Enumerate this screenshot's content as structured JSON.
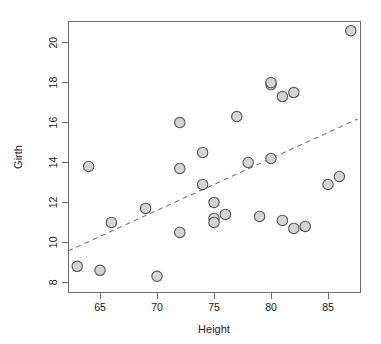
{
  "chart_data": {
    "type": "scatter",
    "title": "",
    "subtitle": "",
    "xlabel": "Height",
    "ylabel": "Girth",
    "xlim": [
      61.6,
      87.9
    ],
    "ylim": [
      7.85,
      20.85
    ],
    "xticks": [
      65,
      70,
      75,
      80,
      85
    ],
    "yticks": [
      8,
      10,
      12,
      14,
      16,
      18,
      20
    ],
    "xtick_labels": [
      "65",
      "70",
      "75",
      "80",
      "85"
    ],
    "ytick_labels": [
      "8",
      "10",
      "12",
      "14",
      "16",
      "18",
      "20"
    ],
    "grid": false,
    "legend": null,
    "legend_position": "none",
    "point_style": {
      "marker": "circle",
      "fill_color": "#d4d4d4",
      "edge_color": "#555555",
      "radius_px": 5.2
    },
    "x": [
      63,
      65,
      70,
      66,
      69,
      72,
      64,
      72,
      74,
      74,
      72,
      75,
      75,
      75,
      76,
      77,
      78,
      79,
      80,
      80,
      80,
      81,
      81,
      82,
      82,
      83,
      85,
      86,
      87
    ],
    "y": [
      8.8,
      8.6,
      8.3,
      11.0,
      11.7,
      13.7,
      13.8,
      16.0,
      14.5,
      12.9,
      10.5,
      12.0,
      11.2,
      11.0,
      11.4,
      16.3,
      14.0,
      11.3,
      14.2,
      17.9,
      18.0,
      11.1,
      17.3,
      17.5,
      10.7,
      10.8,
      12.9,
      13.3,
      20.6
    ],
    "points": [
      {
        "x": 63,
        "y": 8.8
      },
      {
        "x": 65,
        "y": 8.6
      },
      {
        "x": 70,
        "y": 8.3
      },
      {
        "x": 66,
        "y": 11.0
      },
      {
        "x": 69,
        "y": 11.7
      },
      {
        "x": 72,
        "y": 13.7
      },
      {
        "x": 64,
        "y": 13.8
      },
      {
        "x": 72,
        "y": 16.0
      },
      {
        "x": 74,
        "y": 14.5
      },
      {
        "x": 74,
        "y": 12.9
      },
      {
        "x": 72,
        "y": 10.5
      },
      {
        "x": 75,
        "y": 12.0
      },
      {
        "x": 75,
        "y": 11.2
      },
      {
        "x": 75,
        "y": 11.0
      },
      {
        "x": 76,
        "y": 11.4
      },
      {
        "x": 77,
        "y": 16.3
      },
      {
        "x": 78,
        "y": 14.0
      },
      {
        "x": 79,
        "y": 11.3
      },
      {
        "x": 80,
        "y": 14.2
      },
      {
        "x": 80,
        "y": 17.9
      },
      {
        "x": 80,
        "y": 18.0
      },
      {
        "x": 81,
        "y": 11.1
      },
      {
        "x": 81,
        "y": 17.3
      },
      {
        "x": 82,
        "y": 17.5
      },
      {
        "x": 82,
        "y": 10.7
      },
      {
        "x": 83,
        "y": 10.8
      },
      {
        "x": 85,
        "y": 12.9
      },
      {
        "x": 86,
        "y": 13.3
      },
      {
        "x": 87,
        "y": 20.6
      }
    ],
    "series": [
      {
        "name": "trees",
        "type": "scatter",
        "x": [
          63,
          65,
          70,
          66,
          69,
          72,
          64,
          72,
          74,
          74,
          72,
          75,
          75,
          75,
          76,
          77,
          78,
          79,
          80,
          80,
          80,
          81,
          81,
          82,
          82,
          83,
          85,
          86,
          87
        ],
        "values": [
          8.8,
          8.6,
          8.3,
          11.0,
          11.7,
          13.7,
          13.8,
          16.0,
          14.5,
          12.9,
          10.5,
          12.0,
          11.2,
          11.0,
          11.4,
          16.3,
          14.0,
          11.3,
          14.2,
          17.9,
          18.0,
          11.1,
          17.3,
          17.5,
          10.7,
          10.8,
          12.9,
          13.3,
          20.6
        ]
      },
      {
        "name": "trend-line",
        "type": "line",
        "style": "dashed",
        "color": "#777777",
        "x": [
          62.2,
          87.6
        ],
        "values": [
          9.57,
          16.18
        ]
      }
    ],
    "n_points": 29
  },
  "axes": {
    "x_axis_title": "Height",
    "y_axis_title": "Girth",
    "x_tick_labels": [
      "65",
      "70",
      "75",
      "80",
      "85"
    ],
    "y_tick_labels": [
      "8",
      "10",
      "12",
      "14",
      "16",
      "18",
      "20"
    ]
  },
  "colors": {
    "background": "#ffffff",
    "frame": "#6b6b6b",
    "point_fill": "#d4d4d4",
    "point_edge": "#555555",
    "trend": "#777777",
    "text": "#1a1a1a"
  }
}
